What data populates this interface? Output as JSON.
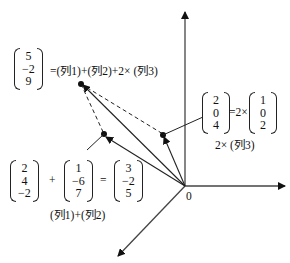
{
  "diagram": {
    "origin_label": "0",
    "top_matrix": {
      "values": [
        "5",
        "−2",
        "9"
      ],
      "equation": "=(列1)+(列2)+2× (列3)"
    },
    "right_matrix": {
      "values": [
        "2",
        "0",
        "4"
      ],
      "eq": "=2×",
      "col3": [
        "1",
        "0",
        "2"
      ],
      "caption": "2× (列3)"
    },
    "bottom": {
      "m1": [
        "2",
        "4",
        "−2"
      ],
      "plus": "+",
      "m2": [
        "1",
        "−6",
        "7"
      ],
      "equals": "=",
      "m3": [
        "3",
        "−2",
        "5"
      ],
      "caption": "(列1)+(列2)"
    }
  }
}
